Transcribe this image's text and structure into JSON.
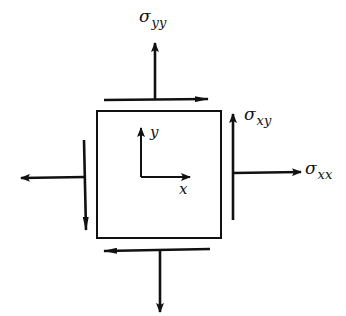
{
  "diagram": {
    "type": "2D stress element",
    "labels": {
      "sigma_yy": {
        "symbol": "σ",
        "subscript": "yy"
      },
      "sigma_xy": {
        "symbol": "σ",
        "subscript": "xy"
      },
      "sigma_xx": {
        "symbol": "σ",
        "subscript": "xx"
      },
      "axis_x": "x",
      "axis_y": "y"
    },
    "colors": {
      "stroke": "#111111",
      "background": "#ffffff"
    }
  }
}
